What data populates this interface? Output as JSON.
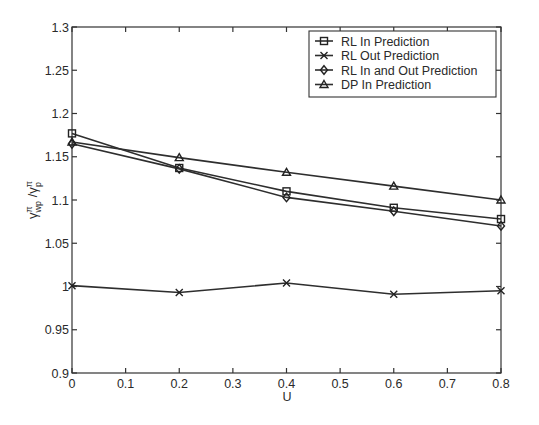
{
  "chart_data": {
    "type": "line",
    "title": "",
    "xlabel": "U",
    "ylabel": "γ^π_wp / γ^π_p",
    "xlim": [
      0,
      0.8
    ],
    "ylim": [
      0.9,
      1.3
    ],
    "grid": false,
    "legend_position": "upper right",
    "x": [
      0,
      0.2,
      0.4,
      0.6,
      0.8
    ],
    "x_ticks": [
      "0",
      "0.1",
      "0.2",
      "0.3",
      "0.4",
      "0.5",
      "0.6",
      "0.7",
      "0.8"
    ],
    "y_ticks": [
      "0.9",
      "0.95",
      "1",
      "1.05",
      "1.1",
      "1.15",
      "1.2",
      "1.25",
      "1.3"
    ],
    "series": [
      {
        "name": "RL In Prediction",
        "marker": "square",
        "values": [
          1.177,
          1.137,
          1.11,
          1.091,
          1.078
        ]
      },
      {
        "name": "RL Out Prediction",
        "marker": "x",
        "values": [
          1.001,
          0.993,
          1.004,
          0.991,
          0.995
        ]
      },
      {
        "name": "RL In and Out Prediction",
        "marker": "diamond",
        "values": [
          1.165,
          1.136,
          1.103,
          1.087,
          1.07
        ]
      },
      {
        "name": "DP In Prediction",
        "marker": "triangle",
        "values": [
          1.167,
          1.149,
          1.132,
          1.116,
          1.1
        ]
      }
    ]
  }
}
